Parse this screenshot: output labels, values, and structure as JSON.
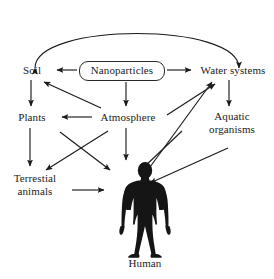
{
  "figure": {
    "background_color": "#ffffff",
    "ink_color": "#1b1b1b",
    "width": 274,
    "height": 279
  },
  "nodes": {
    "nanoparticles": {
      "label": "Nanoparticles",
      "shape": "rounded-rectangle"
    },
    "soil": {
      "label": "Soil",
      "shape": "text"
    },
    "water_systems": {
      "label": "Water systems",
      "shape": "text"
    },
    "plants": {
      "label": "Plants",
      "shape": "text"
    },
    "atmosphere": {
      "label": "Atmosphere",
      "shape": "text"
    },
    "aquatic_organisms": {
      "label": "Aquatic\norganisms",
      "shape": "text"
    },
    "terrestial_animals": {
      "label": "Terrestial\nanimals",
      "shape": "text"
    },
    "human": {
      "label": "Human",
      "shape": "silhouette-figure"
    }
  },
  "icons": {
    "human_figure": "human-silhouette-icon",
    "arrowhead": "arrowhead-icon"
  },
  "edges": [
    {
      "from": "nanoparticles",
      "to": "soil",
      "style": "straight",
      "heads": 1
    },
    {
      "from": "nanoparticles",
      "to": "water_systems",
      "style": "straight",
      "heads": 1
    },
    {
      "from": "nanoparticles",
      "to": "atmosphere",
      "style": "straight",
      "heads": 1
    },
    {
      "from": "soil",
      "to": "water_systems",
      "style": "curved-arc",
      "heads": 2
    },
    {
      "from": "soil",
      "to": "plants",
      "style": "straight",
      "heads": 1
    },
    {
      "from": "water_systems",
      "to": "aquatic_organisms",
      "style": "straight",
      "heads": 1
    },
    {
      "from": "atmosphere",
      "to": "soil",
      "style": "straight",
      "heads": 1
    },
    {
      "from": "atmosphere",
      "to": "plants",
      "style": "straight",
      "heads": 1
    },
    {
      "from": "atmosphere",
      "to": "water_systems",
      "style": "straight",
      "heads": 1
    },
    {
      "from": "atmosphere",
      "to": "human",
      "style": "straight",
      "heads": 1
    },
    {
      "from": "plants",
      "to": "terrestial_animals",
      "style": "straight",
      "heads": 1
    },
    {
      "from": "plants",
      "to": "human",
      "style": "straight",
      "heads": 1
    },
    {
      "from": "terrestial_animals",
      "to": "human",
      "style": "straight",
      "heads": 1
    },
    {
      "from": "water_systems",
      "to": "human",
      "style": "straight",
      "heads": 1
    },
    {
      "from": "aquatic_organisms",
      "to": "human",
      "style": "straight",
      "heads": 1
    },
    {
      "from": "human_area_left",
      "to": "terrestial_animals",
      "style": "straight",
      "heads": 1
    }
  ]
}
